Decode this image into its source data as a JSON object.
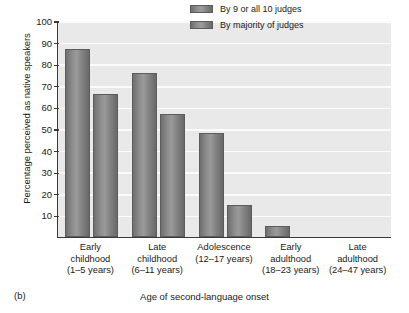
{
  "panel_label": "(b)",
  "chart_data": {
    "type": "bar",
    "title": "",
    "xlabel": "Age of second-language onset",
    "ylabel": "Percentage perceived as native speakers",
    "ylim": [
      0,
      100
    ],
    "yticks": [
      100,
      90,
      80,
      70,
      60,
      50,
      40,
      30,
      20,
      10
    ],
    "grid": true,
    "legend_position": "top-right",
    "categories": [
      "Early\nchildhood\n(1–5 years)",
      "Late\nchildhood\n(6–11 years)",
      "Adolescence\n(12–17 years)",
      "Early\nadulthood\n(18–23 years)",
      "Late\nadulthood\n(24–47 years)"
    ],
    "category_lines": [
      [
        "Early",
        "childhood",
        "(1–5 years)"
      ],
      [
        "Late",
        "childhood",
        "(6–11 years)"
      ],
      [
        "Adolescence",
        "(12–17 years)",
        ""
      ],
      [
        "Early",
        "adulthood",
        "(18–23 years)"
      ],
      [
        "Late",
        "adulthood",
        "(24–47 years)"
      ]
    ],
    "series": [
      {
        "name": "By 9 or all 10 judges",
        "values": [
          87,
          76,
          48,
          5,
          0
        ]
      },
      {
        "name": "By majority of judges",
        "values": [
          66,
          57,
          15,
          0,
          0
        ]
      }
    ]
  },
  "legend": {
    "items": [
      {
        "label": "By 9 or all 10 judges"
      },
      {
        "label": "By majority of judges"
      }
    ]
  },
  "colors": {
    "bar_fill": "#8d8d8d",
    "bar_edge": "#5c5c5c",
    "plot_background": "#e9e9e9",
    "gridline": "#fbfbfb",
    "axis": "#3a3a3a",
    "text": "#1a1a1a"
  }
}
